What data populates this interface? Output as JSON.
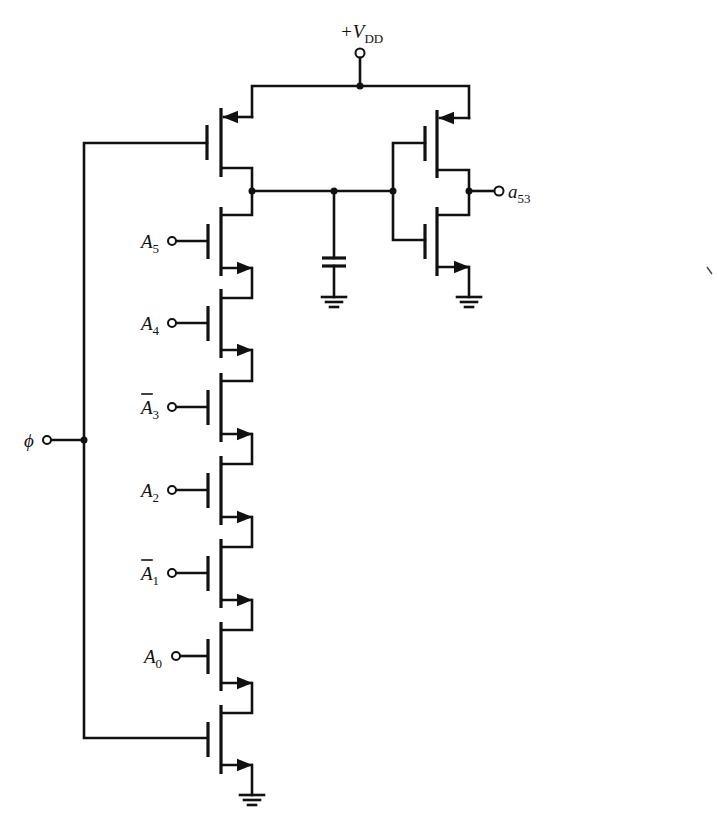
{
  "diagram": {
    "supply_label": "+V",
    "supply_subscript": "DD",
    "clock_label": "ϕ",
    "output_label": "a",
    "output_subscript": "53",
    "address_inputs": [
      {
        "name": "A",
        "sub": "5",
        "bar": false
      },
      {
        "name": "A",
        "sub": "4",
        "bar": false
      },
      {
        "name": "A",
        "sub": "3",
        "bar": true
      },
      {
        "name": "A",
        "sub": "2",
        "bar": false
      },
      {
        "name": "A",
        "sub": "1",
        "bar": true
      },
      {
        "name": "A",
        "sub": "0",
        "bar": false
      }
    ],
    "components": [
      "precharge-pmos",
      "nmos-stack-6",
      "evaluate-nmos",
      "storage-capacitor",
      "output-inverter-pmos",
      "output-inverter-nmos",
      "ground-symbols-3"
    ],
    "colors": {
      "ink": "#111111",
      "background": "#ffffff"
    }
  }
}
